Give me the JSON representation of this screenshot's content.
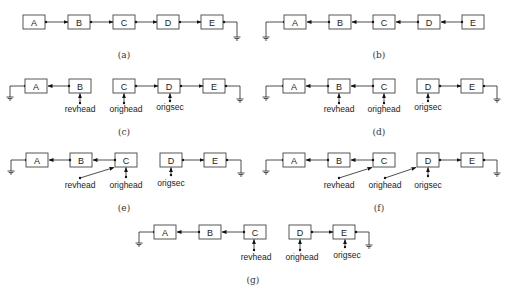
{
  "figure": {
    "panels": [
      {
        "id": "a",
        "caption": "(a)",
        "description": "Singly linked list A→B→C→D→E, E next = null",
        "nodes": [
          "A",
          "B",
          "C",
          "D",
          "E"
        ],
        "pointers": []
      },
      {
        "id": "b",
        "caption": "(b)",
        "description": "Reversed list: E→D→C→B→A, A next = null",
        "nodes": [
          "A",
          "B",
          "C",
          "D",
          "E"
        ],
        "pointers": []
      },
      {
        "id": "c",
        "caption": "(c)",
        "nodes": [
          "A",
          "B",
          "C",
          "D",
          "E"
        ],
        "pointers": [
          {
            "label": "revhead",
            "target": "B"
          },
          {
            "label": "orighead",
            "target": "C"
          },
          {
            "label": "origsec",
            "target": "D"
          }
        ]
      },
      {
        "id": "d",
        "caption": "(d)",
        "nodes": [
          "A",
          "B",
          "C",
          "D",
          "E"
        ],
        "pointers": [
          {
            "label": "revhead",
            "target": "B"
          },
          {
            "label": "orighead",
            "target": "C"
          },
          {
            "label": "origsec",
            "target": "D"
          }
        ]
      },
      {
        "id": "e",
        "caption": "(e)",
        "nodes": [
          "A",
          "B",
          "C",
          "D",
          "E"
        ],
        "pointers": [
          {
            "label": "revhead",
            "target": "C"
          },
          {
            "label": "orighead",
            "target": "C"
          },
          {
            "label": "origsec",
            "target": "D"
          }
        ]
      },
      {
        "id": "f",
        "caption": "(f)",
        "nodes": [
          "A",
          "B",
          "C",
          "D",
          "E"
        ],
        "pointers": [
          {
            "label": "revhead",
            "target": "C"
          },
          {
            "label": "orighead",
            "target": "D"
          },
          {
            "label": "origsec",
            "target": "D"
          }
        ]
      },
      {
        "id": "g",
        "caption": "(g)",
        "nodes": [
          "A",
          "B",
          "C",
          "D",
          "E"
        ],
        "pointers": [
          {
            "label": "revhead",
            "target": "C"
          },
          {
            "label": "orighead",
            "target": "D"
          },
          {
            "label": "origsec",
            "target": "E"
          }
        ]
      }
    ]
  },
  "labels": {
    "revhead": "revhead",
    "orighead": "orighead",
    "origsec": "origsec"
  },
  "colors": {
    "box_stroke": "#444444",
    "line": "#222222",
    "text": "#222222",
    "background": "#ffffff"
  }
}
